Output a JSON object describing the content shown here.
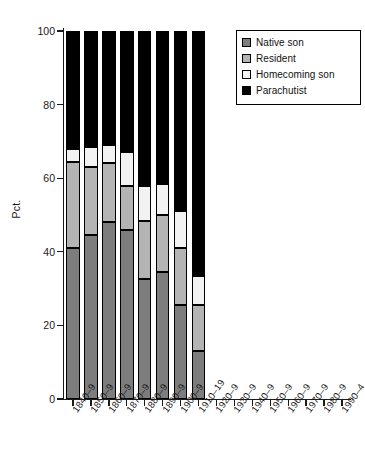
{
  "chart_data": {
    "type": "bar",
    "subtype": "stacked-bar-100",
    "title": "",
    "xlabel": "",
    "ylabel": "Pct.",
    "ylim": [
      0,
      100
    ],
    "yticks": [
      0,
      20,
      40,
      60,
      80,
      100
    ],
    "ytick_labels": [
      "0",
      "20",
      "40",
      "60",
      "80",
      "100"
    ],
    "grid": false,
    "legend_position": "top-right",
    "categories": [
      "1840–9",
      "1850–9",
      "1860–9",
      "1870–9",
      "1880–9",
      "1890–9",
      "1900–9",
      "1910–19",
      "1920–9",
      "1930–9",
      "1940–9",
      "1950–9",
      "1960–9",
      "1970–9",
      "1980–9",
      "1990–4"
    ],
    "series": [
      {
        "name": "Native son",
        "color": "#7d7d7d",
        "values": [
          41,
          44.5,
          48,
          46,
          32.5,
          34.5,
          25.5,
          13,
          null,
          null,
          null,
          null,
          null,
          null,
          null,
          null
        ]
      },
      {
        "name": "Resident",
        "color": "#b4b4b4",
        "values": [
          23.5,
          18.5,
          16,
          12,
          16,
          15.5,
          15.5,
          12.5,
          null,
          null,
          null,
          null,
          null,
          null,
          null,
          null
        ]
      },
      {
        "name": "Homecoming son",
        "color": "#f2f2f2",
        "values": [
          3.5,
          5.5,
          5,
          9,
          9.5,
          8.5,
          10,
          8,
          null,
          null,
          null,
          null,
          null,
          null,
          null,
          null
        ]
      },
      {
        "name": "Parachutist",
        "color": "#000000",
        "values": [
          32,
          31.5,
          31,
          33,
          42,
          41.5,
          49,
          66.5,
          null,
          null,
          null,
          null,
          null,
          null,
          null,
          null
        ]
      }
    ]
  },
  "legend": {
    "items": [
      {
        "label": "Native son",
        "swatch": "swatch-native-son"
      },
      {
        "label": "Resident",
        "swatch": "swatch-resident"
      },
      {
        "label": "Homecoming son",
        "swatch": "swatch-homecoming-son"
      },
      {
        "label": "Parachutist",
        "swatch": "swatch-parachutist"
      }
    ]
  }
}
